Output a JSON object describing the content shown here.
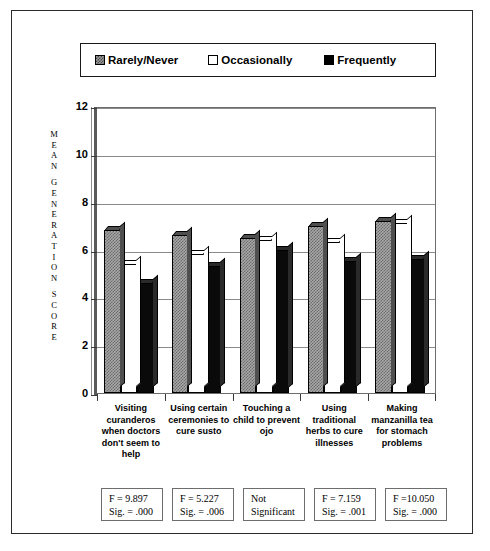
{
  "chart_data": {
    "type": "bar",
    "title": "",
    "xlabel": "",
    "ylabel": "MEAN GENERATION SCORE",
    "ylim": [
      0,
      12
    ],
    "yticks": [
      0,
      2,
      4,
      6,
      8,
      10,
      12
    ],
    "grid": true,
    "legend_position": "top",
    "categories": [
      "Visiting curanderos when doctors don't seem to help",
      "Using certain ceremonies to cure susto",
      "Touching a child to prevent ojo",
      "Using traditional herbs to cure illnesses",
      "Making manzanilla tea for stomach problems"
    ],
    "category_lines": [
      [
        "Visiting",
        "curanderos",
        "when doctors",
        "don't seem to",
        "help"
      ],
      [
        "Using certain",
        "ceremonies to",
        "cure susto"
      ],
      [
        "Touching a",
        "child to prevent",
        "ojo"
      ],
      [
        "Using",
        "traditional",
        "herbs to cure",
        "illnesses"
      ],
      [
        "Making",
        "manzanilla tea",
        "for stomach",
        "problems"
      ]
    ],
    "series": [
      {
        "name": "Rarely/Never",
        "pattern": "hatch",
        "values": [
          6.8,
          6.6,
          6.5,
          7.0,
          7.2
        ]
      },
      {
        "name": "Occasionally",
        "pattern": "white",
        "values": [
          5.4,
          5.8,
          6.4,
          6.3,
          7.1
        ]
      },
      {
        "name": "Frequently",
        "pattern": "black",
        "values": [
          4.6,
          5.3,
          6.0,
          5.5,
          5.6
        ]
      }
    ],
    "annotations": [
      {
        "f_label": "F = 9.897",
        "sig_label": "Sig. = .000"
      },
      {
        "f_label": "F = 5.227",
        "sig_label": "Sig. = .006"
      },
      {
        "f_label": "Not",
        "sig_label": "Significant"
      },
      {
        "f_label": "F = 7.159",
        "sig_label": "Sig. = .001"
      },
      {
        "f_label": "F =10.050",
        "sig_label": "Sig. = .000"
      }
    ]
  },
  "legend": {
    "items": [
      {
        "label": "Rarely/Never",
        "swatch": "hatch-swatch-icon"
      },
      {
        "label": "Occasionally",
        "swatch": "white-swatch-icon"
      },
      {
        "label": "Frequently",
        "swatch": "black-swatch-icon"
      }
    ]
  },
  "axis": {
    "y_caption_letters": [
      "M",
      "E",
      "A",
      "N",
      "",
      "G",
      "E",
      "N",
      "E",
      "R",
      "A",
      "T",
      "I",
      "O",
      "N",
      "",
      "S",
      "C",
      "O",
      "R",
      "E"
    ],
    "y_tick_labels": [
      "12",
      "10",
      "8",
      "6",
      "4",
      "2",
      "0"
    ]
  },
  "colors": {
    "frame": "#2b2b2b",
    "grid": "#8a8a8a",
    "bar_hatch": "#a8a8a8",
    "bar_white": "#ffffff",
    "bar_black": "#0a0a0a"
  }
}
